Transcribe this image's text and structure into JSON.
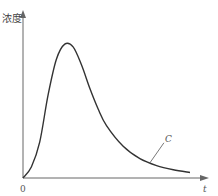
{
  "chart_data": {
    "type": "line",
    "title": "",
    "xlabel": "t",
    "ylabel": "浓度",
    "origin_label": "0",
    "xlim": [
      0,
      10
    ],
    "ylim": [
      0,
      10
    ],
    "grid": false,
    "series": [
      {
        "name": "C",
        "x": [
          0,
          0.5,
          1.0,
          1.5,
          2.0,
          2.5,
          3.0,
          3.5,
          4.0,
          4.5,
          5.0,
          6.0,
          7.0,
          8.0,
          9.0,
          10.0
        ],
        "y": [
          0,
          0.8,
          2.6,
          6.0,
          8.6,
          9.7,
          9.5,
          8.2,
          6.5,
          5.0,
          3.8,
          2.3,
          1.4,
          0.9,
          0.6,
          0.4
        ]
      }
    ],
    "annotations": [
      {
        "text": "C",
        "points_to_x": 7.6
      }
    ]
  }
}
